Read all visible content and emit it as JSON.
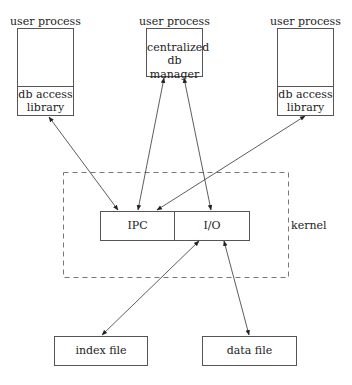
{
  "diagram": {
    "processes": [
      {
        "label": "user process",
        "lower": [
          "db access",
          "library"
        ]
      },
      {
        "label": "user process",
        "upper": [
          "centralized",
          "db manager"
        ]
      },
      {
        "label": "user process",
        "lower": [
          "db access",
          "library"
        ]
      }
    ],
    "kernel": {
      "label": "kernel",
      "ipc": "IPC",
      "io": "I/O"
    },
    "files": {
      "index": "index file",
      "data": "data file"
    }
  }
}
